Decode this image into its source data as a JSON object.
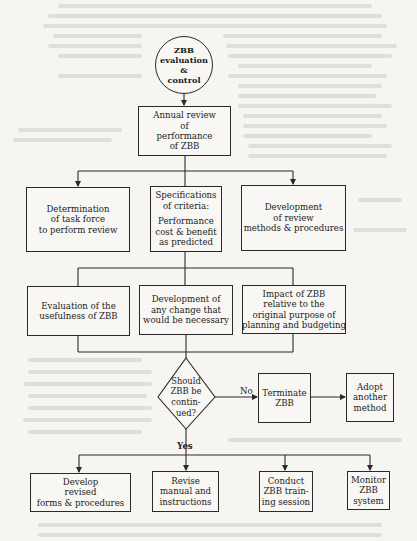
{
  "diagram": {
    "type": "flowchart",
    "start": {
      "lines": [
        "ZBB",
        "evaluation",
        "&",
        "control"
      ]
    },
    "annual_review": {
      "lines": [
        "Annual review",
        "of",
        "performance",
        "of ZBB"
      ]
    },
    "row1": [
      {
        "lines": [
          "Determination",
          "of task force",
          "to perform review"
        ]
      },
      {
        "lines": [
          "Specifications",
          "of criteria:"
        ],
        "sub_lines": [
          "Performance",
          "cost & benefit",
          "as predicted"
        ]
      },
      {
        "lines": [
          "Development",
          "of review",
          "methods & procedures"
        ]
      }
    ],
    "row2": [
      {
        "lines": [
          "Evaluation of the",
          "usefulness of ZBB"
        ]
      },
      {
        "lines": [
          "Development of",
          "any change that",
          "would be necessary"
        ]
      },
      {
        "lines": [
          "Impact of ZBB",
          "relative to the",
          "original purpose of",
          "planning and budgeting"
        ]
      }
    ],
    "decision": {
      "lines": [
        "Should",
        "ZBB be",
        "contin-",
        "ued?"
      ]
    },
    "no_label": "No",
    "yes_label": "Yes",
    "no_branch": [
      {
        "lines": [
          "Terminate",
          "ZBB"
        ]
      },
      {
        "lines": [
          "Adopt",
          "another",
          "method"
        ]
      }
    ],
    "yes_branch": [
      {
        "lines": [
          "Develop",
          "revised",
          "forms & procedures"
        ]
      },
      {
        "lines": [
          "Revise",
          "manual and",
          "instructions"
        ]
      },
      {
        "lines": [
          "Conduct",
          "ZBB train-",
          "ing session"
        ]
      },
      {
        "lines": [
          "Monitor",
          "ZBB",
          "system"
        ]
      }
    ],
    "colors": {
      "background": "#f6f5f2",
      "line": "#2a2a2a",
      "bleed_through": "#d9d8d4"
    }
  }
}
